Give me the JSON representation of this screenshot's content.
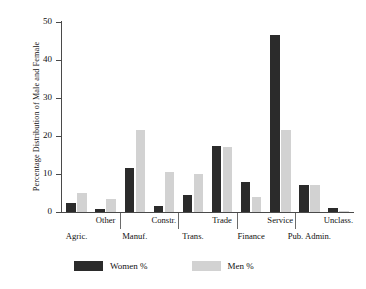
{
  "chart_data": {
    "type": "bar",
    "title": "",
    "subtitle": "",
    "xlabel": "",
    "ylabel": "Percentage Distribution of Male and Female",
    "ylim": [
      0,
      50
    ],
    "yticks": [
      0,
      10,
      20,
      30,
      40,
      50
    ],
    "ytick_labels": [
      "0",
      "10",
      "20",
      "30",
      "40",
      "50"
    ],
    "grid": false,
    "legend_position": "bottom",
    "categories": [
      "Agric.",
      "Other",
      "Manuf.",
      "Constr.",
      "Trans.",
      "Trade",
      "Finance",
      "Service",
      "Pub. Admin.",
      "Unclass."
    ],
    "series": [
      {
        "name": "Women %",
        "color": "#2b2b2b",
        "values": [
          2.5,
          0.7,
          11.5,
          1.5,
          4.5,
          17.5,
          8.0,
          46.5,
          7.0,
          1.0
        ]
      },
      {
        "name": "Men %",
        "color": "#d2d2d2",
        "values": [
          5.0,
          3.5,
          21.5,
          10.5,
          10.0,
          17.0,
          4.0,
          21.5,
          7.0,
          0.3
        ]
      }
    ]
  },
  "axis": {
    "y_title": "Percentage Distribution of Male and Female"
  },
  "x_labels_upper": [
    "Other",
    "Constr.",
    "Trade",
    "Service",
    "Unclass."
  ],
  "x_labels_lower": [
    "Agric.",
    "Manuf.",
    "Trans.",
    "Finance",
    "Pub. Admin."
  ],
  "legend": {
    "items": [
      {
        "label": "Women %",
        "color": "#2b2b2b"
      },
      {
        "label": "Men %",
        "color": "#d2d2d2"
      }
    ]
  }
}
